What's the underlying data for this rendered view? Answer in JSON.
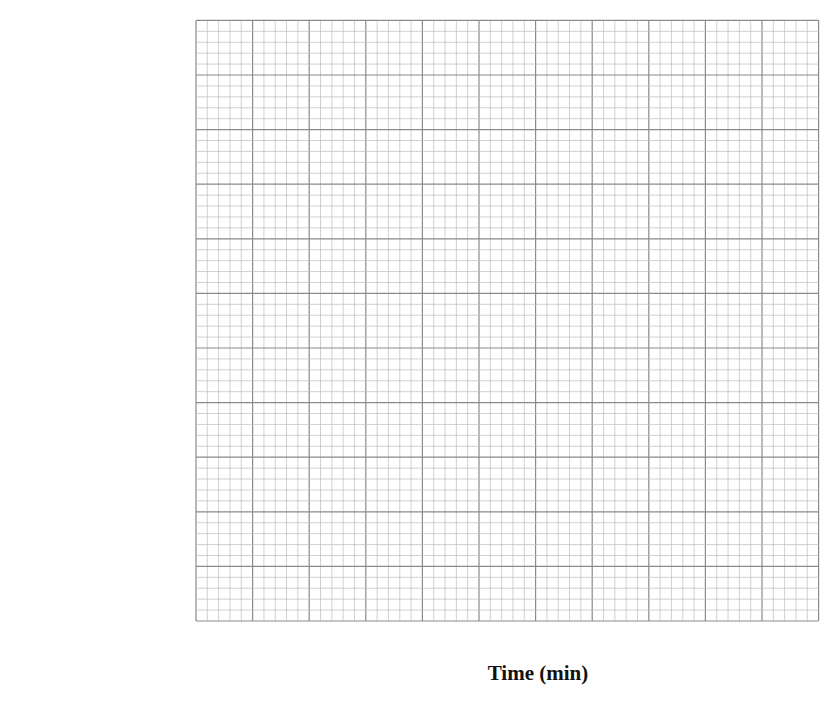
{
  "chart_data": {
    "type": "histogram",
    "title": "",
    "xlabel": "Time (min)",
    "ylabel": [
      "Frequency",
      "density"
    ],
    "xlim": [
      0,
      110
    ],
    "ylim": [
      0,
      22
    ],
    "x_ticks": [
      20,
      40,
      60,
      80,
      100
    ],
    "y_ticks": [
      0,
      2,
      4,
      6,
      8,
      10,
      12,
      14,
      16,
      18,
      20
    ],
    "grid": true,
    "bars": [
      {
        "x_start": 20,
        "x_end": 25,
        "frequency_density": 20
      },
      {
        "x_start": 25,
        "x_end": 40,
        "frequency_density": 14
      },
      {
        "x_start": 40,
        "x_end": 60,
        "frequency_density": 12
      },
      {
        "x_start": 60,
        "x_end": 85,
        "frequency_density": 6
      },
      {
        "x_start": 85,
        "x_end": 90,
        "frequency_density": 6
      }
    ],
    "colors": {
      "bar_fill": "#c8c8c8",
      "bar_stroke": "#111111",
      "grid_minor": "#bdbdbd",
      "grid_major": "#8a8a8a"
    }
  }
}
